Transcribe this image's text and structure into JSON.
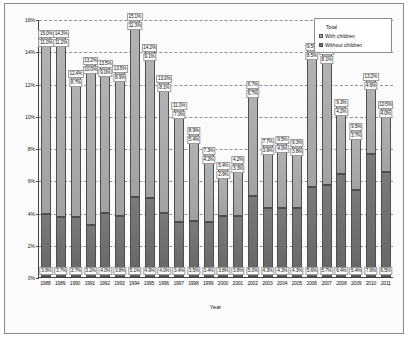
{
  "chart": {
    "type": "bar",
    "xlabel": "Year",
    "ylabel": "",
    "legend": {
      "position": "top-right",
      "entries": [
        {
          "label": "Total",
          "swatch": "line-marker"
        },
        {
          "label": "With children",
          "swatch": "light-gray-square"
        },
        {
          "label": "Without children",
          "swatch": "dark-gray-square"
        }
      ]
    }
  },
  "chart_data": {
    "type": "bar",
    "subtype": "stacked-bar",
    "title": "",
    "xlabel": "Year",
    "ylabel": "",
    "ylim": [
      0,
      16
    ],
    "yticks": [
      "0%",
      "2%",
      "4%",
      "6%",
      "8%",
      "10%",
      "12%",
      "14%",
      "16%"
    ],
    "ytick_values": [
      0,
      2,
      4,
      6,
      8,
      10,
      12,
      14,
      16
    ],
    "grid": true,
    "categories": [
      "1988",
      "1989",
      "1990",
      "1991",
      "1992",
      "1993",
      "1994",
      "1995",
      "1996",
      "1997",
      "1998",
      "1999",
      "2000",
      "2001",
      "2002",
      "2003",
      "2004",
      "2005",
      "2006",
      "2007",
      "2008",
      "2009",
      "2010",
      "2011"
    ],
    "series": [
      {
        "name": "Without children",
        "values": [
          3.9,
          3.7,
          3.7,
          3.2,
          4.0,
          3.8,
          5.1,
          4.9,
          4.0,
          3.4,
          3.5,
          3.4,
          3.8,
          3.8,
          5.0,
          4.3,
          4.3,
          4.3,
          5.6,
          5.7,
          6.4,
          5.4,
          7.6,
          6.5
        ]
      },
      {
        "name": "With children",
        "values": [
          11.0,
          11.2,
          8.7,
          10.0,
          9.0,
          8.9,
          11.3,
          9.1,
          8.1,
          7.0,
          5.4,
          4.2,
          2.9,
          3.3,
          6.7,
          3.9,
          4.0,
          3.8,
          8.5,
          8.1,
          4.2,
          3.7,
          4.6,
          4.0
        ]
      }
    ],
    "totals": {
      "name": "Total",
      "values": [
        15.0,
        14.3,
        12.4,
        13.2,
        13.5,
        13.5,
        15.1,
        14.2,
        13.0,
        11.0,
        8.9,
        7.3,
        5.4,
        4.2,
        6.7,
        7.7,
        9.5,
        9.3,
        9.5,
        11.2,
        9.3,
        9.5,
        13.2,
        10.5
      ]
    },
    "bar_labels": {
      "total": [
        "15.0%",
        "14.3%",
        "12.4%",
        "13.2%",
        "13.5%",
        "13.5%",
        "15.1%",
        "14.2%",
        "13.0%",
        "11.0%",
        "8.9%",
        "7.3%",
        "5.4%",
        "4.2%",
        "6.7%",
        "7.7%",
        "9.5%",
        "9.3%",
        "9.5%",
        "11.2%",
        "9.3%",
        "9.5%",
        "13.2%",
        "10.5%"
      ],
      "with_children": [
        "11.0%",
        "11.2%",
        "8.7%",
        "10.0%",
        "9.0%",
        "8.9%",
        "11.3%",
        "9.1%",
        "8.1%",
        "7.0%",
        "5.4%",
        "4.2%",
        "2.9%",
        "3.3%",
        "6.7%",
        "3.9%",
        "4.0%",
        "3.8%",
        "8.5%",
        "8.1%",
        "4.2%",
        "3.7%",
        "4.6%",
        "4.0%"
      ],
      "without_children": [
        "3.9%",
        "3.7%",
        "3.7%",
        "3.2%",
        "4.0%",
        "3.8%",
        "5.1%",
        "4.9%",
        "4.0%",
        "3.4%",
        "3.5%",
        "3.4%",
        "3.8%",
        "3.8%",
        "5.0%",
        "4.3%",
        "4.3%",
        "4.3%",
        "5.6%",
        "5.7%",
        "6.4%",
        "5.4%",
        "7.6%",
        "6.5%"
      ]
    },
    "colors": {
      "with_children": "#a9a9a9",
      "without_children": "#6f6f6f",
      "gridline": "#7d7d99",
      "axis": "#444444"
    }
  }
}
